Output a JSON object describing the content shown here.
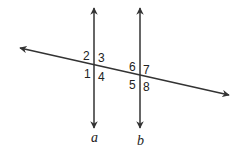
{
  "diagram": {
    "type": "parallel-lines-transversal",
    "line_color": "#333333",
    "lines": [
      {
        "id": "a",
        "label": "a",
        "x": 94,
        "y_top": 8,
        "y_bottom": 128
      },
      {
        "id": "b",
        "label": "b",
        "x": 140,
        "y_top": 8,
        "y_bottom": 128
      }
    ],
    "transversal": {
      "x1": 20,
      "y1": 48,
      "x2": 229,
      "y2": 95
    },
    "angles": [
      {
        "n": "1",
        "x": 84,
        "y": 74
      },
      {
        "n": "2",
        "x": 83,
        "y": 58
      },
      {
        "n": "3",
        "x": 98,
        "y": 61
      },
      {
        "n": "4",
        "x": 98,
        "y": 80
      },
      {
        "n": "5",
        "x": 128,
        "y": 88
      },
      {
        "n": "6",
        "x": 128,
        "y": 70
      },
      {
        "n": "7",
        "x": 143,
        "y": 73
      },
      {
        "n": "8",
        "x": 143,
        "y": 90
      }
    ],
    "line_labels": [
      {
        "text": "a",
        "x": 91,
        "y": 142
      },
      {
        "text": "b",
        "x": 137,
        "y": 145
      }
    ]
  }
}
